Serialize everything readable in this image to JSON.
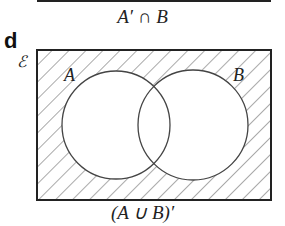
{
  "previous_panel": {
    "caption": "A′ ∩ B"
  },
  "panel": {
    "label": "d",
    "universal_set_symbol": "ℰ",
    "caption": "(A ∪ B)′",
    "sets": [
      {
        "name": "A",
        "cx": 116,
        "cy": 125,
        "r": 54
      },
      {
        "name": "B",
        "cx": 193,
        "cy": 125,
        "r": 55
      }
    ],
    "rectangle": {
      "x": 37,
      "y": 50,
      "width": 234,
      "height": 150
    },
    "shaded_region": "outside A and B",
    "colors": {
      "stroke": "#222222",
      "hatch": "#555555",
      "background": "#ffffff"
    }
  }
}
